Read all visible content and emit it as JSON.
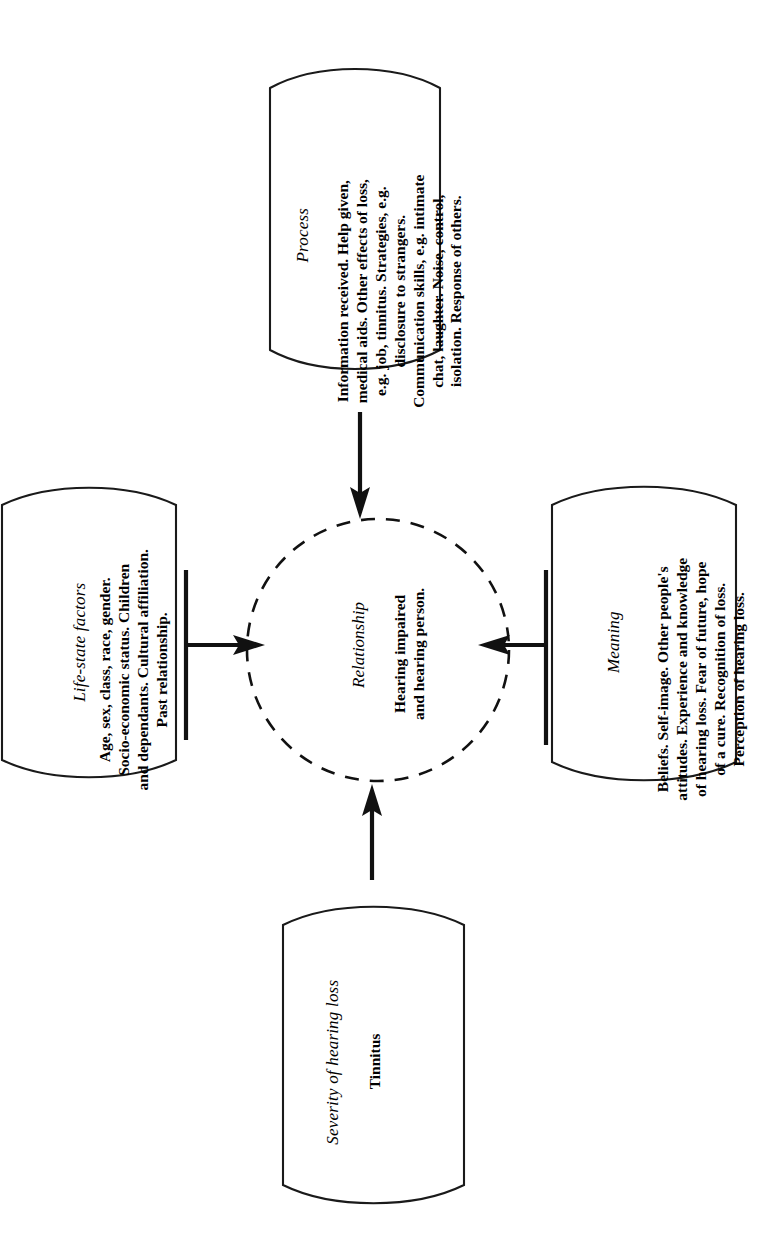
{
  "figure": {
    "orientation": "rotated-90-clockwise",
    "background_color": "#ffffff",
    "line_color": "#111111",
    "center": {
      "shape": "dashed-circle",
      "title": "Relationship",
      "body": "Hearing impaired\nand hearing person."
    },
    "nodes": [
      {
        "id": "process",
        "position": "top",
        "shape": "rounded-capsule",
        "title": "Process",
        "body": "Information received. Help given,\nmedical aids. Other effects of loss,\ne.g. job, tinnitus. Strategies, e.g.\ndisclosure to strangers.\nCommunication skills, e.g. intimate\nchat, laughter. Noise, control,\nisolation. Response of others."
      },
      {
        "id": "life-state-factors",
        "position": "left",
        "shape": "rounded-capsule",
        "title": "Life-state factors",
        "body": "Age, sex, class, race, gender.\nSocio-economic status. Children\nand dependants. Cultural affiliation.\nPast relationship."
      },
      {
        "id": "meaning",
        "position": "right",
        "shape": "rounded-capsule",
        "title": "Meaning",
        "body": "Beliefs. Self-image. Other people's\nattitudes. Experience and knowledge\nof hearing loss. Fear of future, hope\nof a cure. Recognition of loss.\nPerception of hearing loss."
      },
      {
        "id": "severity-of-hearing-loss",
        "position": "bottom",
        "shape": "rounded-capsule",
        "title": "Severity of hearing loss",
        "body": "Tinnitus"
      }
    ],
    "arrows": [
      {
        "from": "process",
        "to": "center",
        "direction": "down"
      },
      {
        "from": "life-state-factors",
        "to": "center",
        "direction": "right"
      },
      {
        "from": "meaning",
        "to": "center",
        "direction": "left"
      },
      {
        "from": "severity-of-hearing-loss",
        "to": "center",
        "direction": "up"
      }
    ]
  }
}
